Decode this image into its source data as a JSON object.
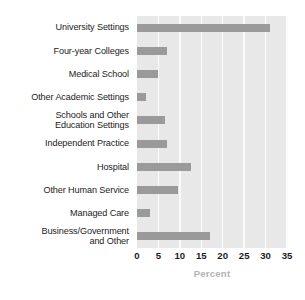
{
  "chart_data": {
    "type": "bar",
    "orientation": "horizontal",
    "title": "",
    "xlabel": "Percent",
    "ylabel": "",
    "xlim": [
      0,
      35
    ],
    "xticks": [
      0,
      5,
      10,
      15,
      20,
      25,
      30,
      35
    ],
    "grid": true,
    "legend": false,
    "bar_color": "#9a9a9a",
    "plot_background": "#e8e8e8",
    "gridline_color": "#fbfbfb",
    "axis_label_color": "#b4b4b4",
    "categories": [
      "University Settings",
      "Four-year Colleges",
      "Medical School",
      "Other Academic Settings",
      "Schools and Other\nEducation Settings",
      "Independent Practice",
      "Hospital",
      "Other Human Service",
      "Managed Care",
      "Business/Government\nand Other"
    ],
    "values": [
      31,
      7,
      5,
      2,
      6.5,
      7,
      12.5,
      9.5,
      3,
      17
    ]
  }
}
